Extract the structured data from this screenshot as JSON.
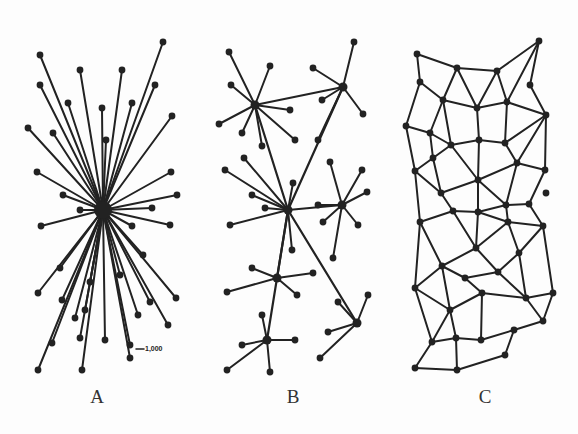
{
  "diagram": {
    "panels": [
      {
        "id": "A",
        "label": "A",
        "type": "centralized",
        "label_x": 97,
        "label_y": 386
      },
      {
        "id": "B",
        "label": "B",
        "type": "decentralized",
        "label_x": 293,
        "label_y": 386
      },
      {
        "id": "C",
        "label": "C",
        "type": "distributed",
        "label_x": 485,
        "label_y": 386
      }
    ],
    "annotation": {
      "text": "1,000",
      "x": 145,
      "y": 345
    },
    "colors": {
      "ink": "#222222",
      "background": "#fdfdfd"
    },
    "A": {
      "hub": [
        103,
        210
      ],
      "leaves": [
        [
          40,
          55
        ],
        [
          163,
          42
        ],
        [
          40,
          85
        ],
        [
          80,
          70
        ],
        [
          122,
          70
        ],
        [
          155,
          85
        ],
        [
          68,
          103
        ],
        [
          102,
          108
        ],
        [
          132,
          103
        ],
        [
          172,
          116
        ],
        [
          28,
          128
        ],
        [
          53,
          133
        ],
        [
          106,
          140
        ],
        [
          37,
          172
        ],
        [
          171,
          172
        ],
        [
          63,
          195
        ],
        [
          177,
          195
        ],
        [
          80,
          210
        ],
        [
          152,
          208
        ],
        [
          41,
          226
        ],
        [
          170,
          225
        ],
        [
          132,
          226
        ],
        [
          143,
          255
        ],
        [
          60,
          268
        ],
        [
          90,
          282
        ],
        [
          120,
          275
        ],
        [
          38,
          293
        ],
        [
          176,
          298
        ],
        [
          62,
          300
        ],
        [
          150,
          302
        ],
        [
          85,
          310
        ],
        [
          75,
          318
        ],
        [
          138,
          315
        ],
        [
          168,
          325
        ],
        [
          52,
          343
        ],
        [
          80,
          338
        ],
        [
          105,
          340
        ],
        [
          130,
          345
        ],
        [
          38,
          370
        ],
        [
          82,
          370
        ],
        [
          130,
          358
        ]
      ]
    },
    "B": {
      "hubs": [
        [
          255,
          105
        ],
        [
          343,
          87
        ],
        [
          288,
          210
        ],
        [
          342,
          205
        ],
        [
          277,
          278
        ],
        [
          267,
          340
        ],
        [
          357,
          323
        ]
      ],
      "hub_links": [
        [
          0,
          1
        ],
        [
          0,
          2
        ],
        [
          1,
          2
        ],
        [
          2,
          3
        ],
        [
          2,
          4
        ],
        [
          2,
          5
        ],
        [
          2,
          6
        ]
      ],
      "leaves": [
        [
          0,
          [
            229,
            52
          ]
        ],
        [
          0,
          [
            270,
            66
          ]
        ],
        [
          0,
          [
            231,
            85
          ]
        ],
        [
          0,
          [
            219,
            124
          ]
        ],
        [
          0,
          [
            242,
            133
          ]
        ],
        [
          0,
          [
            262,
            146
          ]
        ],
        [
          0,
          [
            290,
            110
          ]
        ],
        [
          0,
          [
            295,
            140
          ]
        ],
        [
          1,
          [
            354,
            42
          ]
        ],
        [
          1,
          [
            313,
            68
          ]
        ],
        [
          1,
          [
            322,
            100
          ]
        ],
        [
          1,
          [
            363,
            114
          ]
        ],
        [
          1,
          [
            318,
            140
          ]
        ],
        [
          2,
          [
            225,
            170
          ]
        ],
        [
          2,
          [
            244,
            158
          ]
        ],
        [
          2,
          [
            293,
            183
          ]
        ],
        [
          2,
          [
            252,
            195
          ]
        ],
        [
          2,
          [
            265,
            208
          ]
        ],
        [
          2,
          [
            230,
            225
          ]
        ],
        [
          2,
          [
            292,
            250
          ]
        ],
        [
          3,
          [
            330,
            162
          ]
        ],
        [
          3,
          [
            362,
            170
          ]
        ],
        [
          3,
          [
            367,
            192
          ]
        ],
        [
          3,
          [
            318,
            205
          ]
        ],
        [
          3,
          [
            323,
            222
          ]
        ],
        [
          3,
          [
            358,
            225
          ]
        ],
        [
          3,
          [
            333,
            258
          ]
        ],
        [
          4,
          [
            252,
            268
          ]
        ],
        [
          4,
          [
            313,
            273
          ]
        ],
        [
          4,
          [
            227,
            292
          ]
        ],
        [
          4,
          [
            297,
            295
          ]
        ],
        [
          5,
          [
            262,
            315
          ]
        ],
        [
          5,
          [
            242,
            345
          ]
        ],
        [
          5,
          [
            295,
            340
          ]
        ],
        [
          5,
          [
            227,
            370
          ]
        ],
        [
          5,
          [
            270,
            372
          ]
        ],
        [
          6,
          [
            338,
            302
          ]
        ],
        [
          6,
          [
            368,
            295
          ]
        ],
        [
          6,
          [
            328,
            332
          ]
        ],
        [
          6,
          [
            320,
            358
          ]
        ]
      ]
    },
    "C": {
      "nodes": [
        [
          417,
          54
        ],
        [
          457,
          68
        ],
        [
          497,
          71
        ],
        [
          539,
          41
        ],
        [
          420,
          82
        ],
        [
          530,
          85
        ],
        [
          443,
          100
        ],
        [
          477,
          108
        ],
        [
          507,
          102
        ],
        [
          546,
          115
        ],
        [
          406,
          126
        ],
        [
          430,
          133
        ],
        [
          451,
          145
        ],
        [
          479,
          140
        ],
        [
          505,
          143
        ],
        [
          433,
          158
        ],
        [
          517,
          163
        ],
        [
          545,
          170
        ],
        [
          415,
          171
        ],
        [
          478,
          180
        ],
        [
          441,
          193
        ],
        [
          546,
          193
        ],
        [
          506,
          205
        ],
        [
          529,
          204
        ],
        [
          453,
          211
        ],
        [
          478,
          212
        ],
        [
          508,
          222
        ],
        [
          543,
          226
        ],
        [
          420,
          222
        ],
        [
          476,
          248
        ],
        [
          519,
          253
        ],
        [
          442,
          266
        ],
        [
          465,
          278
        ],
        [
          498,
          272
        ],
        [
          415,
          288
        ],
        [
          482,
          293
        ],
        [
          526,
          298
        ],
        [
          553,
          293
        ],
        [
          450,
          310
        ],
        [
          543,
          321
        ],
        [
          514,
          330
        ],
        [
          432,
          342
        ],
        [
          456,
          338
        ],
        [
          481,
          340
        ],
        [
          505,
          355
        ],
        [
          415,
          368
        ],
        [
          457,
          370
        ]
      ],
      "edges": [
        [
          0,
          1
        ],
        [
          1,
          2
        ],
        [
          2,
          3
        ],
        [
          0,
          4
        ],
        [
          1,
          6
        ],
        [
          1,
          7
        ],
        [
          2,
          7
        ],
        [
          2,
          8
        ],
        [
          3,
          8
        ],
        [
          4,
          6
        ],
        [
          6,
          7
        ],
        [
          7,
          8
        ],
        [
          8,
          9
        ],
        [
          3,
          5
        ],
        [
          5,
          9
        ],
        [
          4,
          10
        ],
        [
          6,
          11
        ],
        [
          6,
          12
        ],
        [
          10,
          11
        ],
        [
          11,
          12
        ],
        [
          12,
          13
        ],
        [
          13,
          14
        ],
        [
          7,
          13
        ],
        [
          8,
          14
        ],
        [
          9,
          14
        ],
        [
          9,
          16
        ],
        [
          11,
          15
        ],
        [
          12,
          15
        ],
        [
          10,
          18
        ],
        [
          15,
          18
        ],
        [
          12,
          19
        ],
        [
          13,
          19
        ],
        [
          14,
          16
        ],
        [
          16,
          19
        ],
        [
          16,
          17
        ],
        [
          9,
          17
        ],
        [
          15,
          20
        ],
        [
          18,
          20
        ],
        [
          19,
          20
        ],
        [
          16,
          22
        ],
        [
          17,
          23
        ],
        [
          22,
          23
        ],
        [
          19,
          22
        ],
        [
          20,
          24
        ],
        [
          24,
          25
        ],
        [
          25,
          22
        ],
        [
          19,
          25
        ],
        [
          23,
          27
        ],
        [
          22,
          26
        ],
        [
          25,
          26
        ],
        [
          26,
          27
        ],
        [
          18,
          28
        ],
        [
          24,
          28
        ],
        [
          28,
          31
        ],
        [
          24,
          29
        ],
        [
          25,
          29
        ],
        [
          29,
          26
        ],
        [
          26,
          30
        ],
        [
          27,
          30
        ],
        [
          29,
          31
        ],
        [
          31,
          32
        ],
        [
          32,
          33
        ],
        [
          29,
          33
        ],
        [
          30,
          33
        ],
        [
          28,
          34
        ],
        [
          31,
          34
        ],
        [
          32,
          35
        ],
        [
          33,
          36
        ],
        [
          30,
          36
        ],
        [
          36,
          37
        ],
        [
          27,
          37
        ],
        [
          34,
          38
        ],
        [
          31,
          38
        ],
        [
          35,
          38
        ],
        [
          35,
          36
        ],
        [
          36,
          39
        ],
        [
          37,
          39
        ],
        [
          38,
          41
        ],
        [
          38,
          42
        ],
        [
          35,
          43
        ],
        [
          42,
          43
        ],
        [
          43,
          40
        ],
        [
          40,
          39
        ],
        [
          40,
          44
        ],
        [
          41,
          42
        ],
        [
          41,
          45
        ],
        [
          45,
          46
        ],
        [
          42,
          46
        ],
        [
          44,
          46
        ],
        [
          34,
          41
        ]
      ]
    }
  }
}
